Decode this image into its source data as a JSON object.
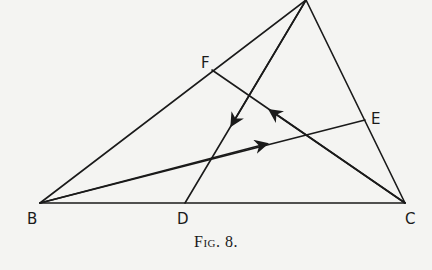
{
  "figure": {
    "caption": "Fig. 8.",
    "line_color": "#1a1a1a",
    "points": {
      "A": {
        "x": 306,
        "y": 0,
        "label": ""
      },
      "B": {
        "x": 40,
        "y": 203,
        "label": "B"
      },
      "C": {
        "x": 405,
        "y": 203,
        "label": "C"
      },
      "D": {
        "x": 185,
        "y": 203,
        "label": "D"
      },
      "E": {
        "x": 365,
        "y": 120,
        "label": "E"
      },
      "F": {
        "x": 212,
        "y": 70,
        "label": "F"
      }
    },
    "segments": [
      {
        "from": "A",
        "to": "B"
      },
      {
        "from": "A",
        "to": "C"
      },
      {
        "from": "B",
        "to": "C"
      },
      {
        "from": "A",
        "to": "D",
        "arrow": "toward D"
      },
      {
        "from": "C",
        "to": "F",
        "arrow": "toward F"
      },
      {
        "from": "B",
        "to": "E",
        "arrow": "toward E"
      }
    ],
    "labels": {
      "B": "B",
      "C": "C",
      "D": "D",
      "E": "E",
      "F": "F"
    }
  }
}
